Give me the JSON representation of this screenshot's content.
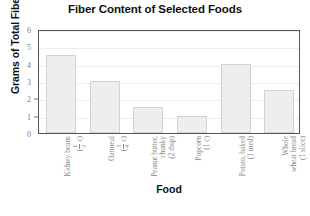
{
  "chart_data": {
    "type": "bar",
    "title": "Fiber Content of Selected Foods",
    "xlabel": "Food",
    "ylabel": "Grams of Total Fiber",
    "ylim": [
      0,
      6
    ],
    "ytick_labels": [
      "6",
      "5",
      "4",
      "3",
      "2",
      "1",
      "0"
    ],
    "ytick_values": [
      6,
      5,
      4,
      3,
      2,
      1,
      0
    ],
    "grid": true,
    "legend": "none",
    "categories": [
      "Kidney beans (1/2 c)",
      "Oatmeal (3/4 c)",
      "Peanut butter, chunky (2 tbsp)",
      "Popcorn (1 c)",
      "Potato, baked (1 med)",
      "Whole wheat bread (1 slice)"
    ],
    "values": [
      4.5,
      3.0,
      1.5,
      1.0,
      4.0,
      2.5
    ],
    "bar_fill_color": "#eeeeee",
    "bar_edge_color": "#d2d2d2",
    "gridline_color": "#ededed",
    "axis_color": "#555555"
  },
  "labels": {
    "items": [
      {
        "line1": "Kidney beans",
        "num": "1",
        "den": "2",
        "unit": "c"
      },
      {
        "line1": "Oatmeal",
        "num": "3",
        "den": "4",
        "unit": "c"
      },
      {
        "line1": "Peanut butter,",
        "line2": "chunky",
        "line3": "(2 tbsp)"
      },
      {
        "line1": "Popcorn",
        "line2": "(1 c)"
      },
      {
        "line1": "Potato, baked",
        "line2": "(1 med)"
      },
      {
        "line1": "Whole",
        "line2": "wheat bread",
        "line3": "(1 slice)"
      }
    ]
  }
}
